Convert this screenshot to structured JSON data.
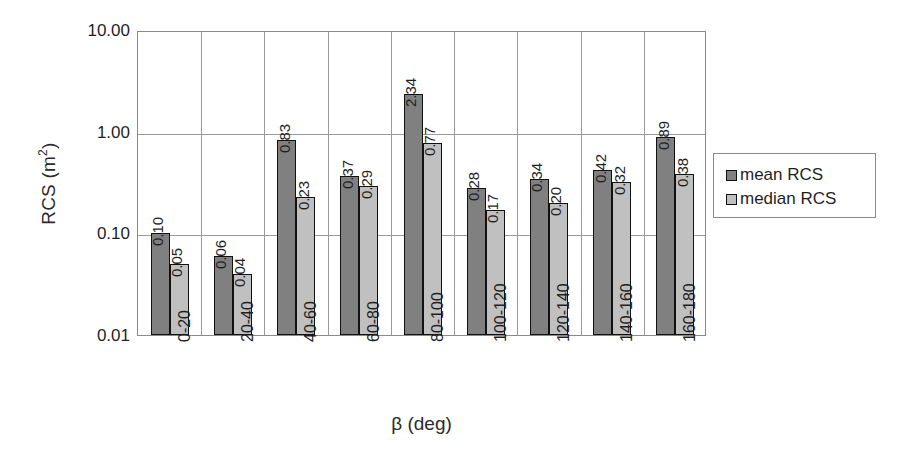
{
  "chart_data": {
    "type": "bar",
    "title": "",
    "xlabel": "β (deg)",
    "ylabel": "RCS (m²)",
    "ylabel_base": "RCS (m",
    "ylabel_sup": "2",
    "ylabel_close": ")",
    "yscale": "log",
    "ylim": [
      0.01,
      10.0
    ],
    "ytick_labels": [
      "10.00",
      "1.00",
      "0.10",
      "0.01"
    ],
    "ytick_values": [
      10.0,
      1.0,
      0.1,
      0.01
    ],
    "grid": "horizontal-and-vertical-group-separators",
    "legend_position": "right-outside",
    "categories": [
      "0-20",
      "20-40",
      "40-60",
      "60-80",
      "80-100",
      "100-120",
      "120-140",
      "140-160",
      "160-180"
    ],
    "series": [
      {
        "name": "mean RCS",
        "color": "#808080",
        "values": [
          0.1,
          0.06,
          0.83,
          0.37,
          2.34,
          0.28,
          0.34,
          0.42,
          0.89
        ],
        "labels": [
          "0.10",
          "0.06",
          "0.83",
          "0.37",
          "2.34",
          "0.28",
          "0.34",
          "0.42",
          "0.89"
        ]
      },
      {
        "name": "median RCS",
        "color": "#c0c0c0",
        "values": [
          0.05,
          0.04,
          0.23,
          0.29,
          0.77,
          0.17,
          0.2,
          0.32,
          0.38
        ],
        "labels": [
          "0.05",
          "0.04",
          "0.23",
          "0.29",
          "0.77",
          "0.17",
          "0.20",
          "0.32",
          "0.38"
        ]
      }
    ]
  },
  "legend": {
    "items": [
      {
        "label": "mean RCS",
        "color": "#808080"
      },
      {
        "label": "median RCS",
        "color": "#c0c0c0"
      }
    ]
  }
}
